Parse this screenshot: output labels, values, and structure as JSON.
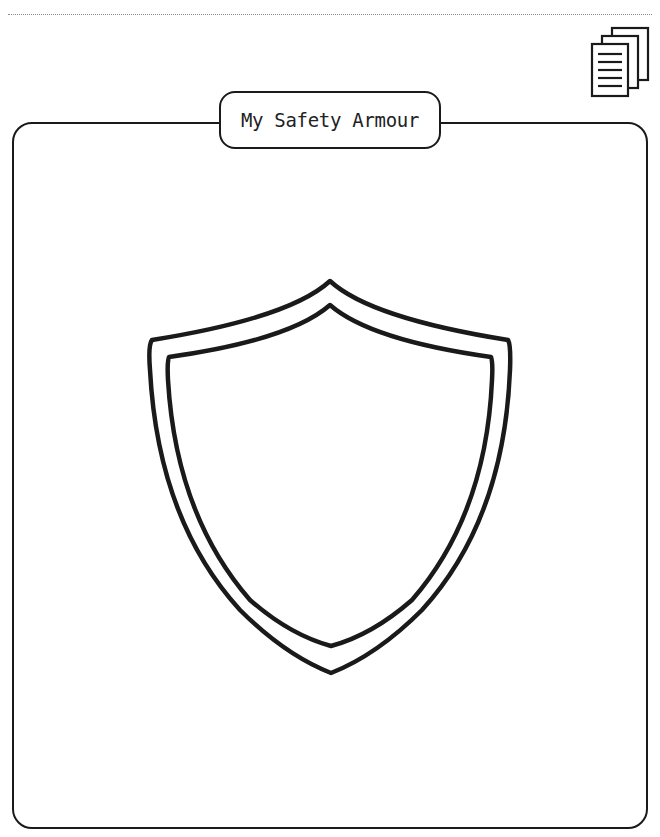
{
  "page": {
    "title": "My Safety Armour"
  },
  "icons": {
    "top_right": "documents-stack-icon",
    "center": "shield-outline-icon"
  },
  "colors": {
    "ink": "#1a1a1a",
    "background": "#ffffff",
    "dotted_rule": "#8a8a8a"
  }
}
